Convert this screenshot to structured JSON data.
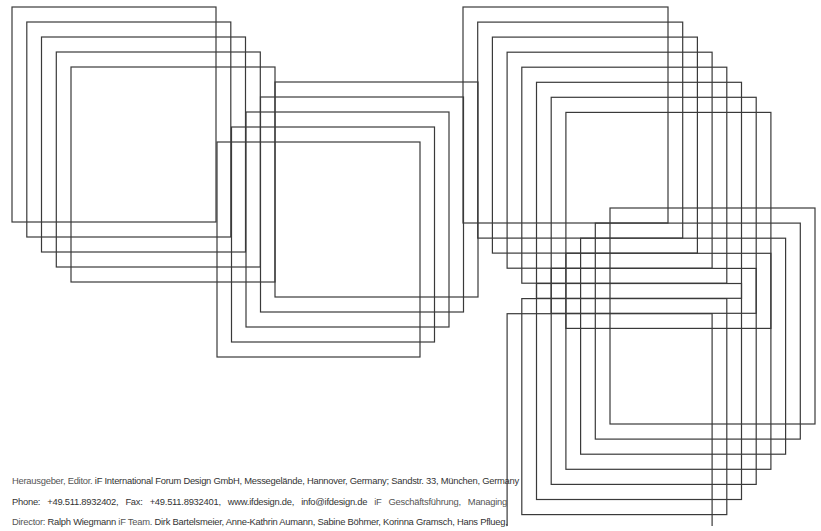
{
  "artwork": {
    "stroke_color": "#3a3a3a",
    "stroke_width": 1.2,
    "clusters": [
      {
        "name": "top-left",
        "count": 5,
        "origin": [
          12,
          7
        ],
        "step": [
          14.75,
          15
        ],
        "size": [
          204,
          215
        ]
      },
      {
        "name": "middle",
        "count": 5,
        "origin": [
          275,
          82
        ],
        "step": [
          -14.5,
          15
        ],
        "size": [
          203,
          215
        ]
      },
      {
        "name": "top-right",
        "count": 8,
        "origin": [
          463,
          7
        ],
        "step": [
          14.7,
          15.05
        ],
        "size": [
          205,
          216
        ]
      },
      {
        "name": "bottom-right",
        "count": 8,
        "origin": [
          610,
          208
        ],
        "step": [
          -14.7,
          15.1
        ],
        "size": [
          205,
          216
        ]
      }
    ]
  },
  "imprint": {
    "line1": {
      "label": "Herausgeber, Editor.",
      "text": " iF International Forum Design GmbH, Messegelände, Hannover, Germany; Sandstr. 33, München, Germany"
    },
    "line2": {
      "phone": "Phone:  +49.511.8932402,",
      "fax": "  Fax:  +49.511.8932401,",
      "web": "  www.ifdesign.de,",
      "email": "  info@ifdesign.de",
      "label": "  iF Geschäftsführung,  Managing"
    },
    "line3": {
      "label": "Director:",
      "director": " Ralph Wiegmann",
      "team_label": " iF Team.",
      "team": " Dirk Bartelsmeier, Anne-Kathrin Aumann, Sabine Böhmer, Korinna Gramsch, Hans Pflueg,"
    }
  }
}
